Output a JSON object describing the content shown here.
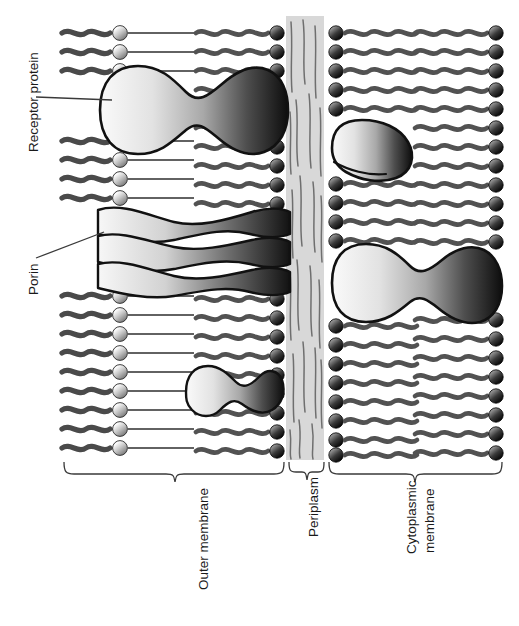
{
  "figure": {
    "background_color": "#ffffff"
  },
  "callout_labels": [
    {
      "id": "receptor-protein",
      "text": "Receptor protein",
      "orientation": "vertical-bottom-to-top"
    },
    {
      "id": "porin",
      "text": "Porin",
      "orientation": "vertical-bottom-to-top"
    }
  ],
  "region_labels": [
    {
      "id": "outer-membrane",
      "text": "Outer membrane",
      "orientation": "vertical-bottom-to-top"
    },
    {
      "id": "periplasm",
      "text": "Periplasm",
      "orientation": "vertical-bottom-to-top"
    },
    {
      "id": "cytoplasmic-membrane",
      "line1": "Cytoplasmic",
      "line2": "membrane",
      "orientation": "vertical-bottom-to-top"
    }
  ],
  "layers": [
    {
      "id": "lps-outer-leaflet",
      "name": "LPS outer leaflet",
      "x": 62,
      "width": 100,
      "head_group": "sphere-light",
      "tail_style": "wavy-then-straight"
    },
    {
      "id": "om-inner-leaflet",
      "name": "Outer membrane inner leaflet (phospholipid)",
      "x": 192,
      "width": 92,
      "head_group": "sphere-dark",
      "tail_style": "wavy"
    },
    {
      "id": "periplasm-space",
      "name": "Periplasm / peptidoglycan",
      "x": 285,
      "width": 40,
      "fill": "#d8d8d8",
      "texture": "strands"
    },
    {
      "id": "cm-outer-leaflet",
      "name": "Cytoplasmic membrane outer leaflet",
      "x": 329,
      "width": 90,
      "head_group": "sphere-dark",
      "tail_style": "wavy"
    },
    {
      "id": "cm-inner-leaflet",
      "name": "Cytoplasmic membrane inner leaflet",
      "x": 422,
      "width": 80,
      "head_group": "sphere-dark",
      "tail_style": "wavy"
    }
  ],
  "proteins": [
    {
      "id": "receptor-protein-shape",
      "shape": "peanut",
      "cx": 190,
      "cy": 110,
      "w": 190,
      "h": 78
    },
    {
      "id": "porin-trimer-shape",
      "shape": "hourglass-trimer",
      "cx": 190,
      "cy": 245,
      "w": 190,
      "h": 100
    },
    {
      "id": "small-om-protein",
      "shape": "peanut-small",
      "cx": 228,
      "cy": 392,
      "w": 95,
      "h": 46
    },
    {
      "id": "cm-bean-protein",
      "shape": "bean",
      "cx": 370,
      "cy": 148,
      "w": 86,
      "h": 56
    },
    {
      "id": "cm-large-protein",
      "shape": "peanut",
      "cx": 418,
      "cy": 283,
      "w": 172,
      "h": 72
    }
  ],
  "colors": {
    "tail_dark": "#4a4a4a",
    "tail_mid": "#585858",
    "head_light_a": "#f2f2f2",
    "head_light_b": "#8d8d8d",
    "head_dark_a": "#6a6a6a",
    "head_dark_b": "#101010",
    "periplasm_fill": "#d8d8d8",
    "periplasm_strand": "#6f6f6f",
    "protein_light": "#f3f3f3",
    "protein_dark": "#141414",
    "outline": "#111111",
    "text": "#1a1a1a",
    "leader": "#3a3a3a"
  },
  "braces": [
    {
      "id": "brace-outer-membrane",
      "x1": 64,
      "x2": 284,
      "y": 470
    },
    {
      "id": "brace-periplasm",
      "x1": 288,
      "x2": 324,
      "y": 470
    },
    {
      "id": "brace-cytoplasmic-membrane",
      "x1": 328,
      "x2": 502,
      "y": 470
    }
  ]
}
